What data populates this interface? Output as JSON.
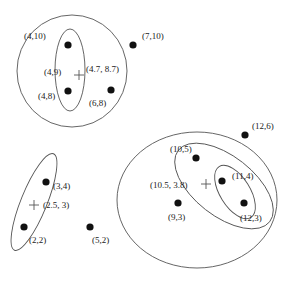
{
  "diagram": {
    "type": "clustering-dendrogram-sets",
    "points": [
      {
        "id": "p4_10",
        "label": "(4,10)",
        "x": 68,
        "y": 45,
        "lx": 24,
        "ly": 39
      },
      {
        "id": "p4_8",
        "label": "(4,8)",
        "x": 68,
        "y": 91,
        "lx": 38,
        "ly": 99
      },
      {
        "id": "p7_10",
        "label": "(7,10)",
        "x": 133,
        "y": 45,
        "lx": 142,
        "ly": 39
      },
      {
        "id": "p6_8",
        "label": "(6,8)",
        "x": 111,
        "y": 90,
        "lx": 89,
        "ly": 106
      },
      {
        "id": "p3_4",
        "label": "(3,4)",
        "x": 46,
        "y": 182,
        "lx": 53,
        "ly": 189
      },
      {
        "id": "p2_2",
        "label": "(2,2)",
        "x": 24,
        "y": 227,
        "lx": 29,
        "ly": 243
      },
      {
        "id": "p5_2",
        "label": "(5,2)",
        "x": 90,
        "y": 227,
        "lx": 92,
        "ly": 243
      },
      {
        "id": "p12_6",
        "label": "(12,6)",
        "x": 245,
        "y": 135,
        "lx": 252,
        "ly": 129
      },
      {
        "id": "p10_5",
        "label": "(10,5)",
        "x": 196,
        "y": 158,
        "lx": 170,
        "ly": 152
      },
      {
        "id": "p11_4",
        "label": "(11,4)",
        "x": 222,
        "y": 181,
        "lx": 232,
        "ly": 179
      },
      {
        "id": "p12_3",
        "label": "(12,3)",
        "x": 244,
        "y": 203,
        "lx": 240,
        "ly": 221
      },
      {
        "id": "p9_3",
        "label": "(9,3)",
        "x": 178,
        "y": 203,
        "lx": 168,
        "ly": 220
      }
    ],
    "centroids": [
      {
        "id": "c1",
        "label": "(4.7, 8.7)",
        "x": 79,
        "y": 75,
        "lx": 86,
        "ly": 72
      },
      {
        "id": "c_inner1",
        "label": "(4,9)",
        "x": 68,
        "y": 68,
        "lx": 44,
        "ly": 75,
        "no_marker": true
      },
      {
        "id": "c2",
        "label": "(2.5, 3)",
        "x": 34,
        "y": 205,
        "lx": 43,
        "ly": 208
      },
      {
        "id": "c3",
        "label": "(10.5, 3.8)",
        "x": 206,
        "y": 184,
        "lx": 150,
        "ly": 188
      }
    ],
    "clusters": [
      {
        "id": "big-circle-top",
        "cx": 72,
        "cy": 71,
        "rx": 55,
        "ry": 56,
        "rotate": 0
      },
      {
        "id": "ellipse-top-inner",
        "cx": 70,
        "cy": 70,
        "rx": 15,
        "ry": 41,
        "rotate": 0
      },
      {
        "id": "ellipse-bottom-left",
        "cx": 34,
        "cy": 202,
        "rx": 13,
        "ry": 52,
        "rotate": 22
      },
      {
        "id": "big-circle-right",
        "cx": 197,
        "cy": 200,
        "rx": 80,
        "ry": 68,
        "rotate": 0
      },
      {
        "id": "ellipse-right-mid",
        "cx": 224,
        "cy": 186,
        "rx": 58,
        "ry": 30,
        "rotate": 38
      },
      {
        "id": "ellipse-right-inner",
        "cx": 235,
        "cy": 192,
        "rx": 30,
        "ry": 15,
        "rotate": 58
      }
    ]
  }
}
